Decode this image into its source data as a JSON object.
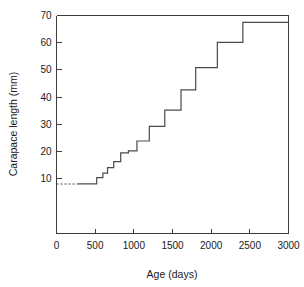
{
  "chart_data": {
    "type": "line",
    "title": "",
    "subtitle": "",
    "xlabel": "Age (days)",
    "ylabel": "Carapace length (mm)",
    "xlim": [
      0,
      3000
    ],
    "ylim": [
      7,
      70
    ],
    "xticks": [
      0,
      500,
      1000,
      1500,
      2000,
      2500,
      3000
    ],
    "yticks": [
      10,
      20,
      30,
      40,
      50,
      60,
      70
    ],
    "grid": false,
    "legend": null,
    "step_style": "post",
    "series": [
      {
        "name": "growth (moult steps)",
        "style": "solid",
        "x": [
          280,
          520,
          520,
          600,
          600,
          660,
          660,
          740,
          740,
          830,
          830,
          930,
          930,
          1040,
          1040,
          1200,
          1200,
          1400,
          1400,
          1610,
          1610,
          1800,
          1800,
          2080,
          2080,
          2410,
          2410,
          3000
        ],
        "y": [
          8.0,
          8.0,
          10.3,
          10.3,
          12.0,
          12.0,
          14.0,
          14.0,
          16.2,
          16.2,
          19.4,
          19.4,
          20.2,
          20.2,
          23.8,
          23.8,
          29.2,
          29.2,
          35.2,
          35.2,
          42.6,
          42.6,
          50.8,
          50.8,
          60.1,
          60.1,
          67.5,
          67.5
        ]
      },
      {
        "name": "hatchling baseline (extrapolated)",
        "style": "dashed",
        "x": [
          0,
          280
        ],
        "y": [
          8.0,
          8.0
        ]
      }
    ],
    "steps": [
      {
        "age_days": 280,
        "carapace_mm": 8.0
      },
      {
        "age_days": 520,
        "carapace_mm": 10.3
      },
      {
        "age_days": 600,
        "carapace_mm": 12.0
      },
      {
        "age_days": 660,
        "carapace_mm": 14.0
      },
      {
        "age_days": 740,
        "carapace_mm": 16.2
      },
      {
        "age_days": 830,
        "carapace_mm": 19.4
      },
      {
        "age_days": 930,
        "carapace_mm": 20.2
      },
      {
        "age_days": 1040,
        "carapace_mm": 23.8
      },
      {
        "age_days": 1200,
        "carapace_mm": 29.2
      },
      {
        "age_days": 1400,
        "carapace_mm": 35.2
      },
      {
        "age_days": 1610,
        "carapace_mm": 42.6
      },
      {
        "age_days": 1800,
        "carapace_mm": 50.8
      },
      {
        "age_days": 2080,
        "carapace_mm": 60.1
      },
      {
        "age_days": 2410,
        "carapace_mm": 67.5
      }
    ],
    "colors": {
      "line": "#4a4a4a",
      "axis": "#3c3c3c",
      "text": "#1a1a1a",
      "background": "#ffffff"
    }
  },
  "labels": {
    "xtick_0": "0",
    "xtick_1": "500",
    "xtick_2": "1000",
    "xtick_3": "1500",
    "xtick_4": "2000",
    "xtick_5": "2500",
    "xtick_6": "3000",
    "ytick_0": "10",
    "ytick_1": "20",
    "ytick_2": "30",
    "ytick_3": "40",
    "ytick_4": "50",
    "ytick_5": "60",
    "ytick_6": "70",
    "xaxis_title": "Age (days)",
    "yaxis_title": "Carapace length (mm)"
  }
}
